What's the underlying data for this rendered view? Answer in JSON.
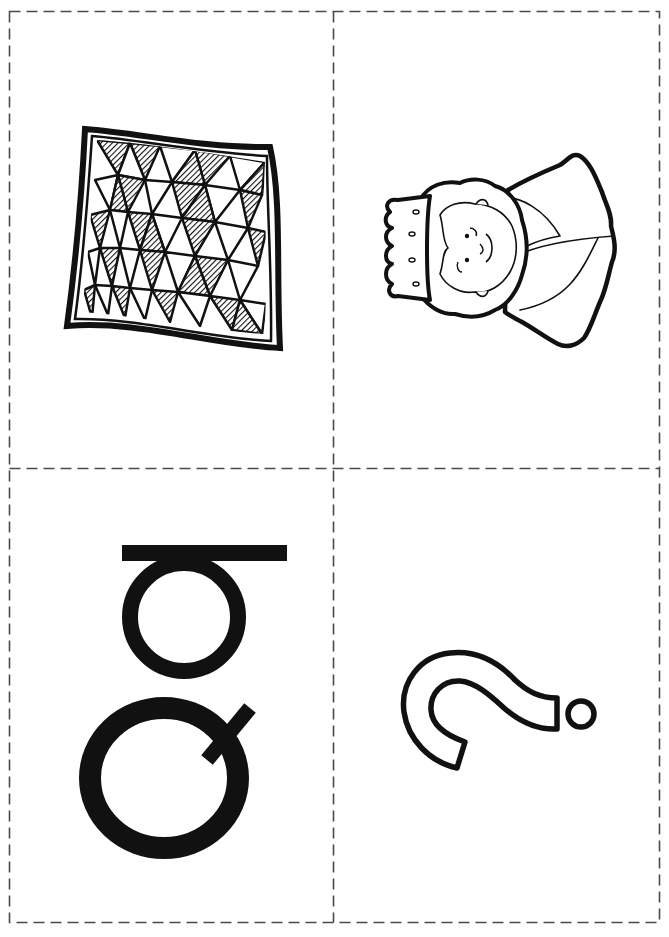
{
  "sheet": {
    "layout": "2x2 cut-out flashcards",
    "border_style": "dashed",
    "border_color": "#4a4a4a",
    "ink_color": "#111111",
    "background": "#ffffff"
  },
  "cards": [
    {
      "position": "top-left",
      "content": "quilt",
      "kind": "picture",
      "rotation_deg": 0
    },
    {
      "position": "top-right",
      "content": "queen",
      "kind": "picture",
      "rotation_deg": -90
    },
    {
      "position": "bottom-left",
      "content": "Q q",
      "kind": "letters",
      "letters": [
        "q",
        "Q"
      ],
      "rotation_deg": 90
    },
    {
      "position": "bottom-right",
      "content": "?",
      "kind": "symbol",
      "rotation_deg": 90
    }
  ]
}
